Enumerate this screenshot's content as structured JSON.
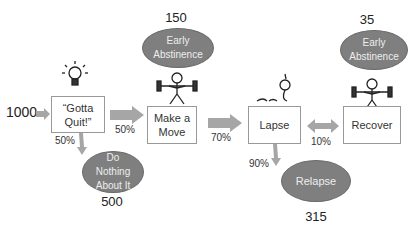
{
  "input_count": "1000",
  "boxes": {
    "gotta_quit": "“Gotta Quit!”",
    "make_move": "Make a Move",
    "lapse": "Lapse",
    "recover": "Recover"
  },
  "ellipses": {
    "early_abstinence_1": {
      "label": "Early Abstinence",
      "count": "150"
    },
    "do_nothing": {
      "label": "Do Nothing About It",
      "count": "500"
    },
    "relapse": {
      "label": "Relapse",
      "count": "315"
    },
    "early_abstinence_2": {
      "label": "Early Abstinence",
      "count": "35"
    }
  },
  "percentages": {
    "quit_to_move": "50%",
    "quit_to_nothing": "50%",
    "move_to_lapse": "70%",
    "lapse_to_relapse": "90%",
    "lapse_recover": "10%"
  },
  "icons": [
    "lightbulb-icon",
    "weightlifter-icon",
    "fallen-person-icon",
    "weightlifter-icon"
  ],
  "colors": {
    "ellipse": "#7f7f7f",
    "arrow": "#a6a6a6",
    "box_border": "#999999"
  }
}
